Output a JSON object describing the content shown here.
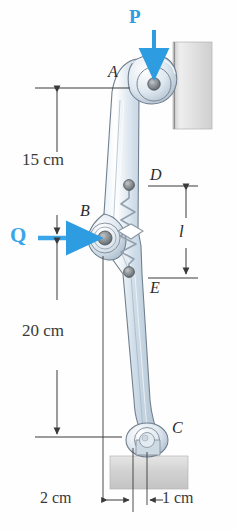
{
  "figure": {
    "type": "engineering-mechanics-diagram"
  },
  "labels": {
    "point_a": "A",
    "point_b": "B",
    "point_c": "C",
    "point_d": "D",
    "point_e": "E",
    "spring_length": "l"
  },
  "forces": {
    "p_label": "P",
    "p_color": "#2e9ce0",
    "q_label": "Q",
    "q_color": "#3aa5e8"
  },
  "dimensions": {
    "upper": "15 cm",
    "lower": "20 cm",
    "offset_left": "2 cm",
    "offset_right": "1 cm"
  },
  "colors": {
    "link_body": "#d7e3ee",
    "link_edge": "#6f7d8c",
    "pin_fill": "#8a8f93",
    "wall_fill": "#dcdcdc",
    "base_fill": "#d6d6d6",
    "dim_line": "#3a3a3a",
    "spring": "#9aa6b2"
  }
}
